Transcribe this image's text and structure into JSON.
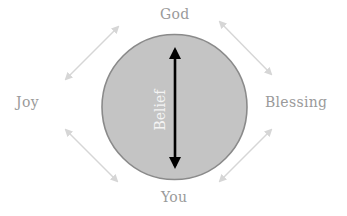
{
  "diagram": {
    "nodes": {
      "top": "God",
      "bottom": "You",
      "left": "Joy",
      "right": "Blessing"
    },
    "center": {
      "label": "Belief",
      "shape": "circle",
      "arrow": "double-headed vertical"
    },
    "connections": [
      {
        "from": "Joy",
        "to": "God",
        "type": "double-arrow"
      },
      {
        "from": "God",
        "to": "Blessing",
        "type": "double-arrow"
      },
      {
        "from": "Joy",
        "to": "You",
        "type": "double-arrow"
      },
      {
        "from": "You",
        "to": "Blessing",
        "type": "double-arrow"
      }
    ],
    "colors": {
      "circle_fill": "#c4c4c4",
      "circle_stroke": "#8a8a8a",
      "center_arrow": "#000000",
      "side_arrows": "#d6d6d6",
      "node_text": "#9a9a9a",
      "center_text": "#f4f4f4",
      "background": "#ffffff"
    }
  }
}
